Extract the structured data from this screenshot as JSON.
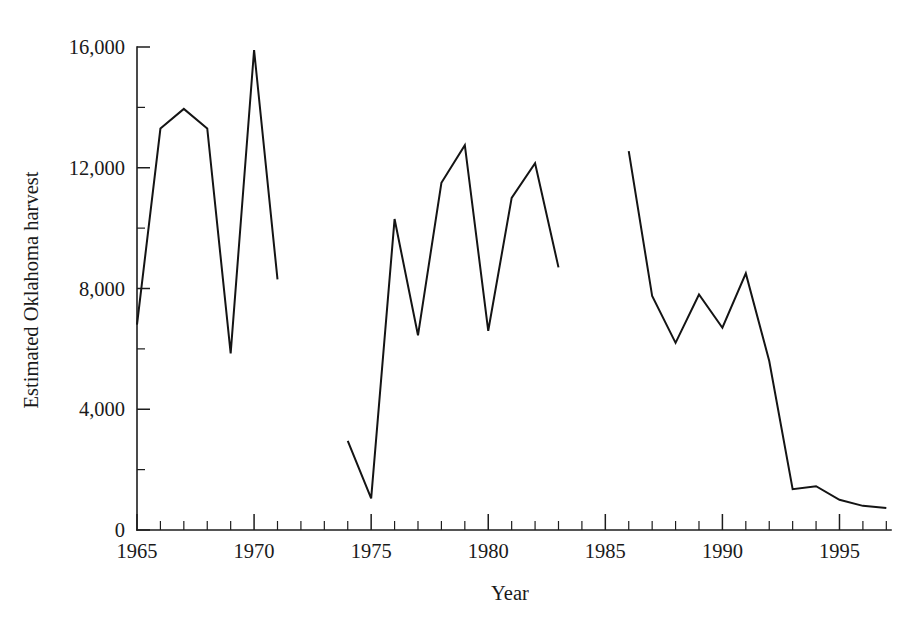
{
  "chart_data": {
    "type": "line",
    "title": "",
    "xlabel": "Year",
    "ylabel": "Estimated Oklahoma harvest",
    "xlim": [
      1965,
      1997.2
    ],
    "ylim": [
      0,
      16000
    ],
    "grid": false,
    "legend": "none",
    "x_major_ticks": [
      1965,
      1970,
      1975,
      1980,
      1985,
      1990,
      1995
    ],
    "x_major_tick_labels": [
      "1965",
      "1970",
      "1975",
      "1980",
      "1985",
      "1990",
      "1995"
    ],
    "x_minor_tick_step": 1,
    "y_major_ticks": [
      0,
      4000,
      8000,
      12000,
      16000
    ],
    "y_major_tick_labels": [
      "0",
      "4,000",
      "8,000",
      "12,000",
      "16,000"
    ],
    "y_minor_ticks": [
      2000,
      6000,
      10000,
      14000
    ],
    "line_color": "#141414",
    "background_color": "#ffffff",
    "segments": [
      {
        "name": "1965-1971",
        "x": [
          1965,
          1966,
          1967,
          1968,
          1969,
          1970,
          1971
        ],
        "y": [
          6800,
          13300,
          13950,
          13300,
          5850,
          15900,
          8300
        ]
      },
      {
        "name": "1974-1983",
        "x": [
          1974,
          1975,
          1976,
          1977,
          1978,
          1979,
          1980,
          1981,
          1982,
          1983
        ],
        "y": [
          2950,
          1050,
          10300,
          6450,
          11500,
          12750,
          6600,
          11000,
          12150,
          8700
        ]
      },
      {
        "name": "1986-1997",
        "x": [
          1986,
          1987,
          1988,
          1989,
          1990,
          1991,
          1992,
          1993,
          1994,
          1995,
          1996,
          1997
        ],
        "y": [
          12550,
          7750,
          6200,
          7800,
          6700,
          8500,
          5600,
          1350,
          1450,
          1000,
          800,
          730
        ]
      }
    ]
  }
}
